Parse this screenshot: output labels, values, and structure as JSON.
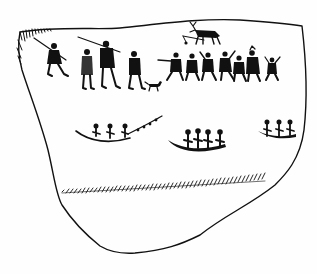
{
  "image": {
    "description": "Line drawing of an engraved stone/bark fragment showing a procession of human figures, a reindeer, and three boats with rowers",
    "colors": {
      "ink": "#111111",
      "background": "#fefefe"
    },
    "scenes": [
      {
        "name": "procession-left",
        "figures": 4,
        "note": "four walking figures, two carrying long poles"
      },
      {
        "name": "dog",
        "figures": 1
      },
      {
        "name": "reindeer",
        "figures": 1
      },
      {
        "name": "procession-right",
        "figures": 7,
        "note": "group of dancing/marching figures"
      },
      {
        "name": "boats",
        "count": 3,
        "rowers": [
          3,
          4,
          3
        ]
      },
      {
        "name": "hatched-band",
        "note": "horizontal hatched line near bottom"
      }
    ]
  }
}
